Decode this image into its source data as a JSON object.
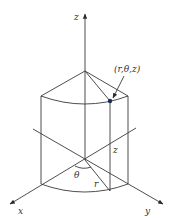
{
  "diagram": {
    "colors": {
      "line": "#3a3a3a",
      "point": "#1a2f5a",
      "background": "#ffffff"
    },
    "labels": {
      "z_axis": "z",
      "x_axis": "x",
      "y_axis": "y",
      "point": "(r,θ,z)",
      "height": "z",
      "radius": "r",
      "angle": "θ"
    },
    "geometry": {
      "origin": [
        85,
        160
      ],
      "top_center": [
        85,
        71
      ],
      "point": [
        110,
        101
      ],
      "point_base": [
        110,
        191
      ]
    }
  }
}
